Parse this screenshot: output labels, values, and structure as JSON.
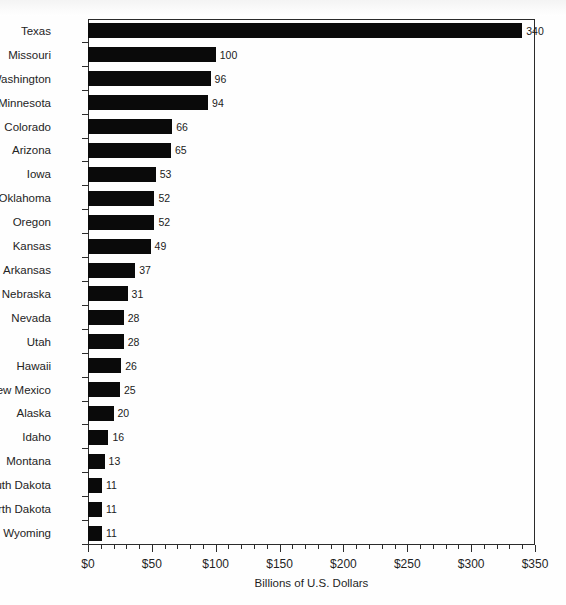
{
  "chart_data": {
    "type": "bar",
    "orientation": "horizontal",
    "title": "",
    "xlabel": "Billions of U.S. Dollars",
    "ylabel": "",
    "xlim": [
      0,
      350
    ],
    "xticks": [
      "$0",
      "$50",
      "$100",
      "$150",
      "$200",
      "$250",
      "$300",
      "$350"
    ],
    "xtick_values": [
      0,
      50,
      100,
      150,
      200,
      250,
      300,
      350
    ],
    "minor_tick_step": 10,
    "grid": false,
    "legend": false,
    "bar_color": "#0a0a0a",
    "axis_color": "#2b2b2b",
    "categories": [
      "Texas",
      "Missouri",
      "Washington",
      "Minnesota",
      "Colorado",
      "Arizona",
      "Iowa",
      "Oklahoma",
      "Oregon",
      "Kansas",
      "Arkansas",
      "Nebraska",
      "Nevada",
      "Utah",
      "Hawaii",
      "New Mexico",
      "Alaska",
      "Idaho",
      "Montana",
      "South Dakota",
      "North Dakota",
      "Wyoming"
    ],
    "values": [
      340,
      100,
      96,
      94,
      66,
      65,
      53,
      52,
      52,
      49,
      37,
      31,
      28,
      28,
      26,
      25,
      20,
      16,
      13,
      11,
      11,
      11
    ],
    "value_labels": [
      "340",
      "100",
      "96",
      "94",
      "66",
      "65",
      "53",
      "52",
      "52",
      "49",
      "37",
      "31",
      "28",
      "28",
      "26",
      "25",
      "20",
      "16",
      "13",
      "11",
      "11",
      "11"
    ]
  }
}
